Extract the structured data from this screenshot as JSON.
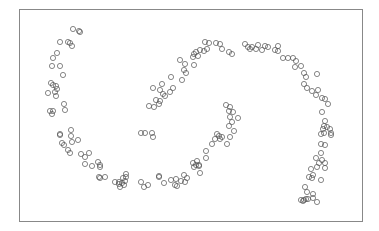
{
  "chart_data": {
    "type": "scatter",
    "title": "",
    "xlabel": "",
    "ylabel": "",
    "grid": false,
    "legend": null,
    "frame": {
      "x": 19,
      "y": 9,
      "width": 343,
      "height": 212,
      "color": "#888888"
    },
    "marker": {
      "shape": "open-circle",
      "radius": 2.6,
      "stroke": "#555555"
    },
    "series": [
      {
        "name": "left-arc",
        "points": [
          [
            73,
            29
          ],
          [
            79,
            31
          ],
          [
            80,
            32
          ],
          [
            60,
            42
          ],
          [
            68,
            42
          ],
          [
            70,
            43
          ],
          [
            72,
            46
          ],
          [
            57,
            53
          ],
          [
            53,
            58
          ],
          [
            52,
            66
          ],
          [
            60,
            66
          ],
          [
            63,
            75
          ],
          [
            51,
            83
          ],
          [
            53,
            85
          ],
          [
            56,
            86
          ],
          [
            57,
            89
          ],
          [
            55,
            92
          ],
          [
            48,
            93
          ],
          [
            56,
            96
          ],
          [
            64,
            104
          ],
          [
            50,
            111
          ],
          [
            53,
            111
          ],
          [
            65,
            110
          ],
          [
            52,
            114
          ],
          [
            60,
            134
          ],
          [
            60,
            135
          ],
          [
            71,
            130
          ],
          [
            71,
            136
          ],
          [
            72,
            142
          ],
          [
            78,
            140
          ],
          [
            62,
            143
          ],
          [
            64,
            145
          ],
          [
            68,
            150
          ],
          [
            70,
            153
          ],
          [
            81,
            154
          ],
          [
            85,
            157
          ],
          [
            89,
            153
          ],
          [
            85,
            164
          ],
          [
            92,
            166
          ],
          [
            98,
            162
          ],
          [
            100,
            165
          ],
          [
            100,
            167
          ],
          [
            99,
            177
          ],
          [
            100,
            178
          ],
          [
            105,
            177
          ],
          [
            115,
            182
          ],
          [
            119,
            184
          ],
          [
            120,
            187
          ],
          [
            122,
            183
          ],
          [
            123,
            178
          ],
          [
            126,
            174
          ],
          [
            126,
            177
          ],
          [
            119,
            182
          ],
          [
            124,
            185
          ],
          [
            125,
            181
          ]
        ]
      },
      {
        "name": "bottom-trough",
        "points": [
          [
            141,
            182
          ],
          [
            144,
            187
          ],
          [
            148,
            185
          ],
          [
            159,
            176
          ],
          [
            159,
            177
          ],
          [
            164,
            183
          ],
          [
            171,
            180
          ],
          [
            176,
            179
          ],
          [
            175,
            185
          ],
          [
            181,
            181
          ],
          [
            184,
            175
          ],
          [
            187,
            178
          ],
          [
            177,
            186
          ],
          [
            185,
            182
          ]
        ]
      },
      {
        "name": "upper-arc",
        "points": [
          [
            141,
            133
          ],
          [
            145,
            133
          ],
          [
            152,
            133
          ],
          [
            153,
            137
          ],
          [
            149,
            106
          ],
          [
            154,
            107
          ],
          [
            159,
            104
          ],
          [
            156,
            100
          ],
          [
            160,
            101
          ],
          [
            165,
            96
          ],
          [
            153,
            88
          ],
          [
            160,
            90
          ],
          [
            170,
            92
          ],
          [
            162,
            84
          ],
          [
            163,
            94
          ],
          [
            173,
            88
          ],
          [
            171,
            77
          ],
          [
            182,
            80
          ],
          [
            184,
            70
          ],
          [
            186,
            73
          ],
          [
            180,
            60
          ],
          [
            185,
            64
          ],
          [
            194,
            65
          ],
          [
            193,
            57
          ],
          [
            194,
            54
          ],
          [
            196,
            52
          ],
          [
            198,
            56
          ],
          [
            200,
            50
          ],
          [
            204,
            51
          ],
          [
            207,
            49
          ],
          [
            205,
            42
          ],
          [
            209,
            43
          ],
          [
            216,
            43
          ],
          [
            220,
            44
          ],
          [
            222,
            49
          ],
          [
            229,
            52
          ],
          [
            232,
            54
          ],
          [
            245,
            44
          ],
          [
            248,
            47
          ],
          [
            250,
            49
          ],
          [
            252,
            47
          ],
          [
            256,
            49
          ],
          [
            258,
            45
          ],
          [
            262,
            50
          ],
          [
            265,
            46
          ],
          [
            268,
            47
          ],
          [
            275,
            50
          ],
          [
            278,
            51
          ],
          [
            278,
            46
          ],
          [
            283,
            58
          ],
          [
            288,
            58
          ],
          [
            293,
            58
          ],
          [
            296,
            61
          ],
          [
            295,
            67
          ],
          [
            301,
            66
          ],
          [
            304,
            73
          ],
          [
            306,
            77
          ],
          [
            317,
            74
          ],
          [
            304,
            84
          ],
          [
            307,
            88
          ],
          [
            312,
            91
          ],
          [
            318,
            90
          ],
          [
            316,
            95
          ],
          [
            322,
            98
          ],
          [
            325,
            99
          ],
          [
            328,
            104
          ],
          [
            322,
            112
          ],
          [
            325,
            121
          ]
        ]
      },
      {
        "name": "inner-arc",
        "points": [
          [
            226,
            105
          ],
          [
            230,
            107
          ],
          [
            229,
            111
          ],
          [
            233,
            112
          ],
          [
            230,
            117
          ],
          [
            238,
            118
          ],
          [
            232,
            122
          ],
          [
            229,
            126
          ],
          [
            234,
            131
          ],
          [
            230,
            137
          ],
          [
            227,
            144
          ],
          [
            222,
            137
          ],
          [
            217,
            134
          ],
          [
            219,
            136
          ],
          [
            220,
            139
          ],
          [
            215,
            139
          ],
          [
            212,
            144
          ],
          [
            206,
            151
          ],
          [
            206,
            158
          ],
          [
            197,
            161
          ],
          [
            193,
            163
          ],
          [
            196,
            165
          ],
          [
            194,
            167
          ],
          [
            199,
            166
          ],
          [
            200,
            173
          ],
          [
            199,
            165
          ]
        ]
      },
      {
        "name": "right-descend",
        "points": [
          [
            324,
            126
          ],
          [
            327,
            127
          ],
          [
            330,
            129
          ],
          [
            324,
            133
          ],
          [
            321,
            134
          ],
          [
            323,
            129
          ],
          [
            331,
            135
          ],
          [
            331,
            133
          ],
          [
            321,
            144
          ],
          [
            325,
            145
          ],
          [
            321,
            153
          ],
          [
            316,
            158
          ],
          [
            322,
            160
          ],
          [
            325,
            163
          ],
          [
            319,
            163
          ],
          [
            325,
            168
          ],
          [
            317,
            167
          ],
          [
            311,
            169
          ],
          [
            313,
            175
          ],
          [
            309,
            177
          ],
          [
            312,
            178
          ],
          [
            321,
            180
          ],
          [
            305,
            187
          ],
          [
            307,
            192
          ],
          [
            313,
            194
          ],
          [
            306,
            199
          ],
          [
            308,
            199
          ],
          [
            313,
            198
          ],
          [
            317,
            202
          ],
          [
            301,
            200
          ],
          [
            304,
            200
          ],
          [
            303,
            201
          ]
        ]
      }
    ]
  }
}
